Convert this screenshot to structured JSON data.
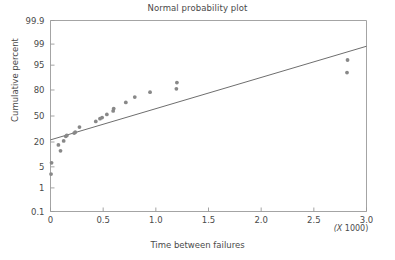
{
  "chart_data": {
    "type": "scatter",
    "title": "Normal probability plot",
    "xlabel": "Time between failures",
    "ylabel": "Cumulative percent",
    "x_multiplier_label": "(X 1000)",
    "grid": false,
    "legend": "none",
    "xlim": [
      0,
      3.0
    ],
    "ylim_percent": [
      0.1,
      99.9
    ],
    "y_scale": "normal-probability",
    "xticks": [
      "0",
      "0.5",
      "1.0",
      "1.5",
      "2.0",
      "2.5",
      "3.0"
    ],
    "xtick_values": [
      0,
      0.5,
      1.0,
      1.5,
      2.0,
      2.5,
      3.0
    ],
    "yticks": [
      "99.9",
      "99",
      "95",
      "80",
      "50",
      "20",
      "5",
      "1",
      "0.1"
    ],
    "ytick_values": [
      99.9,
      99,
      95,
      80,
      50,
      20,
      5,
      1,
      0.1
    ],
    "point_color": "#888888",
    "line_color": "#6e6e6e",
    "axis_color": "#9a9a9a",
    "text_color": "#4a4a4a",
    "series": [
      {
        "name": "Time between failures",
        "points": [
          {
            "x": 0.005,
            "y": 3.0
          },
          {
            "x": 0.01,
            "y": 6.5
          },
          {
            "x": 0.075,
            "y": 17.5
          },
          {
            "x": 0.095,
            "y": 13.0
          },
          {
            "x": 0.125,
            "y": 21.0
          },
          {
            "x": 0.145,
            "y": 25.5
          },
          {
            "x": 0.155,
            "y": 26.5
          },
          {
            "x": 0.225,
            "y": 29.0
          },
          {
            "x": 0.235,
            "y": 30.0
          },
          {
            "x": 0.275,
            "y": 36.0
          },
          {
            "x": 0.43,
            "y": 43.0
          },
          {
            "x": 0.47,
            "y": 46.5
          },
          {
            "x": 0.49,
            "y": 48.0
          },
          {
            "x": 0.535,
            "y": 52.0
          },
          {
            "x": 0.595,
            "y": 56.5
          },
          {
            "x": 0.6,
            "y": 59.5
          },
          {
            "x": 0.715,
            "y": 67.0
          },
          {
            "x": 0.8,
            "y": 73.0
          },
          {
            "x": 0.945,
            "y": 78.0
          },
          {
            "x": 1.195,
            "y": 81.0
          },
          {
            "x": 1.2,
            "y": 86.0
          },
          {
            "x": 2.815,
            "y": 92.0
          },
          {
            "x": 2.82,
            "y": 96.5
          }
        ]
      }
    ],
    "fit_line": {
      "name": "normal fit line",
      "x_start": 0,
      "y_start_percent": 22.0,
      "x_end": 3.0,
      "y_end_percent": 98.8
    }
  }
}
